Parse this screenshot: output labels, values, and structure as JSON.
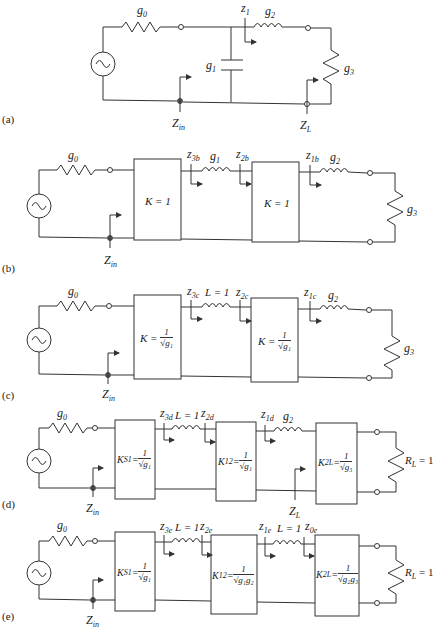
{
  "panels": [
    {
      "id": "a",
      "label": "(a)",
      "source_resistor": "g",
      "source_resistor_sub": "0",
      "shunt_capacitor": "g",
      "shunt_capacitor_sub": "1",
      "series_inductor": "g",
      "series_inductor_sub": "2",
      "load_resistor": "g",
      "load_resistor_sub": "3",
      "z_label": "z",
      "z_label_sub": "1",
      "zin": "Z",
      "zin_sub": "in",
      "zl": "Z",
      "zl_sub": "L"
    },
    {
      "id": "b",
      "label": "(b)",
      "source_resistor": "g",
      "source_resistor_sub": "0",
      "inverter1": "K = 1",
      "inverter2": "K = 1",
      "inductor1": "g",
      "inductor1_sub": "1",
      "inductor2": "g",
      "inductor2_sub": "2",
      "load_resistor": "g",
      "load_resistor_sub": "3",
      "z3": "z",
      "z3_sub": "3b",
      "z2": "z",
      "z2_sub": "2b",
      "z1": "z",
      "z1_sub": "1b",
      "zin": "Z",
      "zin_sub": "in"
    },
    {
      "id": "c",
      "label": "(c)",
      "source_resistor": "g",
      "source_resistor_sub": "0",
      "inverter1_prefix": "K =",
      "inverter1_num": "1",
      "inverter1_den": "√g₁",
      "inverter2_prefix": "K =",
      "inverter2_num": "1",
      "inverter2_den": "√g₁",
      "inductor1": "L = 1",
      "inductor2": "g",
      "inductor2_sub": "2",
      "load_resistor": "g",
      "load_resistor_sub": "3",
      "z3": "z",
      "z3_sub": "3c",
      "z2": "z",
      "z2_sub": "2c",
      "z1": "z",
      "z1_sub": "1c",
      "zin": "Z",
      "zin_sub": "in"
    },
    {
      "id": "d",
      "label": "(d)",
      "source_resistor": "g",
      "source_resistor_sub": "0",
      "inverter1_prefix": "K",
      "inverter1_prefix_sub": "S1",
      "inverter1_num": "1",
      "inverter1_den": "√g₁",
      "inverter2_prefix": "K",
      "inverter2_prefix_sub": "12",
      "inverter2_num": "1",
      "inverter2_den": "√g₁",
      "inverter3_prefix": "K",
      "inverter3_prefix_sub": "2L",
      "inverter3_num": "1",
      "inverter3_den": "√g₃",
      "inductor1": "L = 1",
      "inductor2": "g",
      "inductor2_sub": "2",
      "load_resistor": "R",
      "load_resistor_sub": "L",
      "load_value": "= 1",
      "z3": "z",
      "z3_sub": "3d",
      "z2": "z",
      "z2_sub": "2d",
      "z1": "z",
      "z1_sub": "1d",
      "zin": "Z",
      "zin_sub": "in",
      "zl": "Z",
      "zl_sub": "L"
    },
    {
      "id": "e",
      "label": "(e)",
      "source_resistor": "g",
      "source_resistor_sub": "0",
      "inverter1_prefix": "K",
      "inverter1_prefix_sub": "S1",
      "inverter1_num": "1",
      "inverter1_den": "√g₁",
      "inverter2_prefix": "K",
      "inverter2_prefix_sub": "12",
      "inverter2_num": "1",
      "inverter2_den": "√g₁g₂",
      "inverter3_prefix": "K",
      "inverter3_prefix_sub": "2L",
      "inverter3_num": "1",
      "inverter3_den": "√g₂g₃",
      "inductor1": "L = 1",
      "inductor2": "L = 1",
      "load_resistor": "R",
      "load_resistor_sub": "L",
      "load_value": "= 1",
      "z3": "z",
      "z3_sub": "3e",
      "z2": "z",
      "z2_sub": "2e",
      "z1": "z",
      "z1_sub": "1e",
      "z0": "z",
      "z0_sub": "0e",
      "zin": "Z",
      "zin_sub": "in"
    }
  ]
}
